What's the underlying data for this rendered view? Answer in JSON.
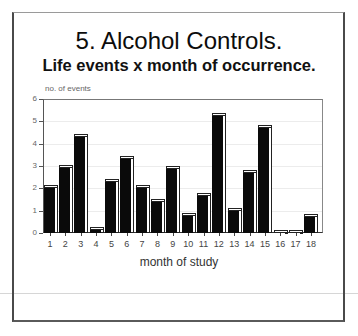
{
  "document": {
    "title": "5. Alcohol Controls.",
    "subtitle": "Life events x month of occurrence."
  },
  "chart_data": {
    "type": "bar",
    "title": "5. Alcohol Controls.",
    "subtitle": "Life events x month of occurrence.",
    "xlabel": "month of study",
    "ylabel": "no. of events",
    "ylim": [
      0,
      6
    ],
    "yticks": [
      "0",
      "1",
      "2",
      "3",
      "4",
      "5",
      "6"
    ],
    "grid": true,
    "legend": null,
    "style": "3D black bars",
    "categories": [
      "1",
      "2",
      "3",
      "4",
      "5",
      "6",
      "7",
      "8",
      "9",
      "10",
      "11",
      "12",
      "13",
      "14",
      "15",
      "16",
      "17",
      "18"
    ],
    "values": [
      2.0,
      2.9,
      4.3,
      0.15,
      2.3,
      3.3,
      2.0,
      1.4,
      2.85,
      0.75,
      1.65,
      5.25,
      1.0,
      2.7,
      4.7,
      0,
      0,
      0.7
    ],
    "colors": {
      "bar": "#0a0a0a",
      "highlight": "#ffffff",
      "axis": "#555555"
    }
  }
}
